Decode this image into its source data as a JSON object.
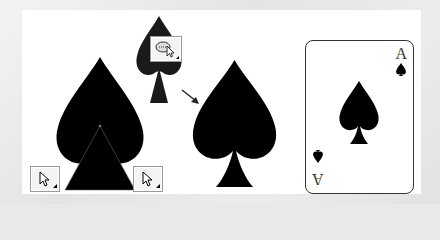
{
  "figure": {
    "colors": {
      "shape_fill": "#000000",
      "panel_bg": "#ffffff",
      "page_bg": "#e9e9e9",
      "card_border": "#333333",
      "tool_border": "#9a9a9a"
    }
  },
  "steps": [
    {
      "name": "spade-with-triangle-stem",
      "tools": [
        "selection-arrow",
        "selection-arrow"
      ]
    },
    {
      "name": "merged-spade-preview",
      "tools": [
        "shape-builder"
      ]
    },
    {
      "name": "final-spade"
    },
    {
      "name": "ace-of-spades-card"
    }
  ],
  "card": {
    "rank_top": "A",
    "rank_bottom": "A",
    "suit": "♠"
  }
}
